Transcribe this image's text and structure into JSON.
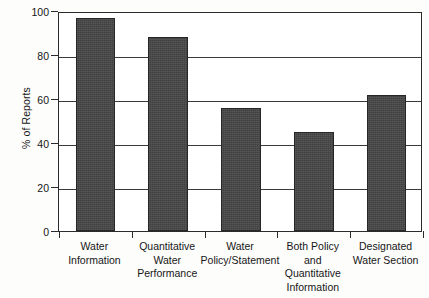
{
  "chart_data": {
    "type": "bar",
    "title": "",
    "subtitle": "",
    "xlabel": "",
    "ylabel": "% of Reports",
    "ylim": [
      0,
      100
    ],
    "yticks": [
      0,
      20,
      40,
      60,
      80,
      100
    ],
    "ytick_labels": [
      "0",
      "20",
      "40",
      "60",
      "80",
      "100"
    ],
    "grid": "horizontal",
    "legend": "none",
    "bar_color": "#474747",
    "categories": [
      "Water\nInformation",
      "Quantitative\nWater\nPerformance",
      "Water\nPolicy/Statement",
      "Both Policy\nand\nQuantitative\nInformation",
      "Designated\nWater Section"
    ],
    "category_lines": [
      [
        "Water",
        "Information"
      ],
      [
        "Quantitative",
        "Water",
        "Performance"
      ],
      [
        "Water",
        "Policy/Statement"
      ],
      [
        "Both Policy",
        "and",
        "Quantitative",
        "Information"
      ],
      [
        "Designated",
        "Water Section"
      ]
    ],
    "values": [
      97,
      88,
      56,
      45,
      62
    ],
    "series": [
      {
        "name": "% of Reports",
        "values": [
          97,
          88,
          56,
          45,
          62
        ]
      }
    ]
  }
}
